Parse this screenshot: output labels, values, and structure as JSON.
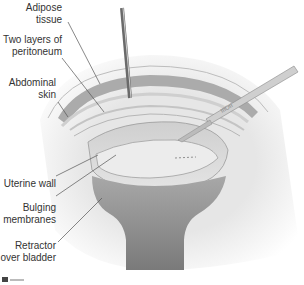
{
  "figure": {
    "labels": [
      {
        "id": "adipose",
        "lines": [
          "Adipose",
          "tissue"
        ]
      },
      {
        "id": "peritoneum",
        "lines": [
          "Two layers of",
          "peritoneum"
        ]
      },
      {
        "id": "skin",
        "lines": [
          "Abdominal",
          "skin"
        ]
      },
      {
        "id": "uterine",
        "lines": [
          "Uterine wall"
        ]
      },
      {
        "id": "membranes",
        "lines": [
          "Bulging",
          "membranes"
        ]
      },
      {
        "id": "retractor",
        "lines": [
          "Retractor",
          "over bladder"
        ]
      }
    ],
    "instruments": [
      "forceps-icon",
      "scalpel-icon",
      "retractor-icon"
    ],
    "colors": {
      "skin": "#e9e9e9",
      "tissue_dark": "#a9a9a9",
      "uterus": "#d6d6d6",
      "membranes": "#e2e2e2",
      "retractor": "#8a8a8a",
      "leader": "#555555",
      "text": "#333333"
    }
  }
}
